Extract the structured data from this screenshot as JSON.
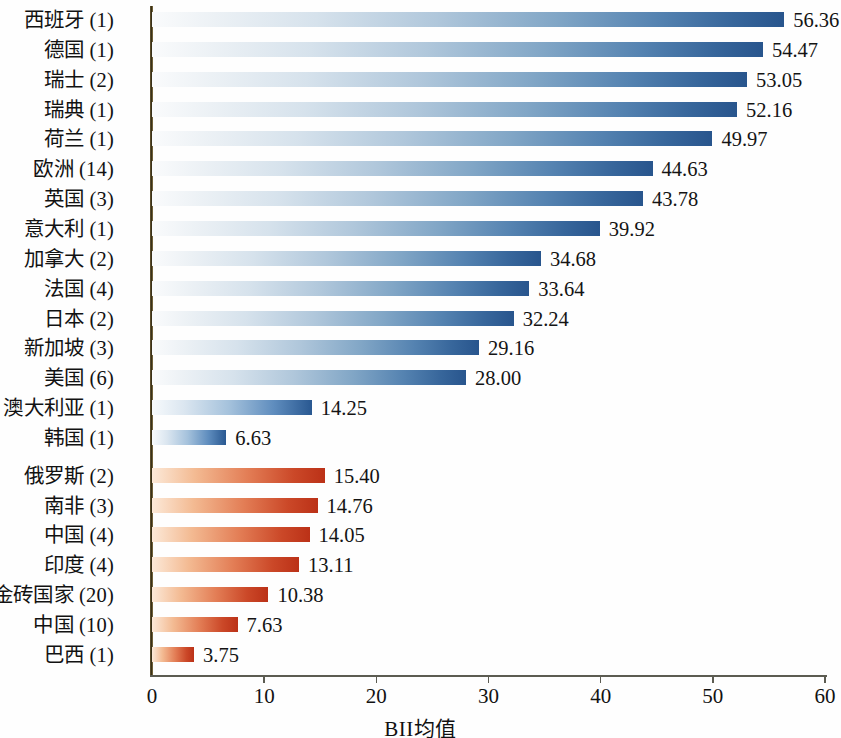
{
  "chart_data": {
    "type": "bar",
    "orientation": "horizontal",
    "title": "",
    "xlabel": "BII均值",
    "ylabel": "",
    "xlim": [
      0,
      60
    ],
    "xticks": [
      0,
      10,
      20,
      30,
      40,
      50,
      60
    ],
    "grid": false,
    "legend": null,
    "categories": [
      "西班牙 (1)",
      "德国 (1)",
      "瑞士 (2)",
      "瑞典 (1)",
      "荷兰 (1)",
      "欧洲 (14)",
      "英国 (3)",
      "意大利 (1)",
      "加拿大 (2)",
      "法国 (4)",
      "日本 (2)",
      "新加坡 (3)",
      "美国 (6)",
      "澳大利亚 (1)",
      "韩国 (1)",
      "俄罗斯 (2)",
      "南非 (3)",
      "中国 (4)",
      "印度 (4)",
      "金砖国家 (20)",
      "中国 (10)",
      "巴西 (1)"
    ],
    "values": [
      56.36,
      54.47,
      53.05,
      52.16,
      49.97,
      44.63,
      43.78,
      39.92,
      34.68,
      33.64,
      32.24,
      29.16,
      28.0,
      14.25,
      6.63,
      15.4,
      14.76,
      14.05,
      13.11,
      10.38,
      7.63,
      3.75
    ],
    "value_labels": [
      "56.36",
      "54.47",
      "53.05",
      "52.16",
      "49.97",
      "44.63",
      "43.78",
      "39.92",
      "34.68",
      "33.64",
      "32.24",
      "29.16",
      "28.00",
      "14.25",
      "6.63",
      "15.40",
      "14.76",
      "14.05",
      "13.11",
      "10.38",
      "7.63",
      "3.75"
    ],
    "group_of_bar": [
      "blue",
      "blue",
      "blue",
      "blue",
      "blue",
      "blue",
      "blue",
      "blue",
      "blue",
      "blue",
      "blue",
      "blue",
      "blue",
      "blue",
      "blue",
      "red",
      "red",
      "red",
      "red",
      "red",
      "red",
      "red"
    ],
    "groups": {
      "blue": {
        "name": "发达经济体",
        "color_light": "#fafbfc",
        "color_dark": "#28558d"
      },
      "red": {
        "name": "新兴经济体",
        "color_light": "#fdefe2",
        "color_dark": "#bc3318"
      }
    },
    "axis_color": "#5c5c52",
    "y_axis_color": "#3a3118"
  }
}
